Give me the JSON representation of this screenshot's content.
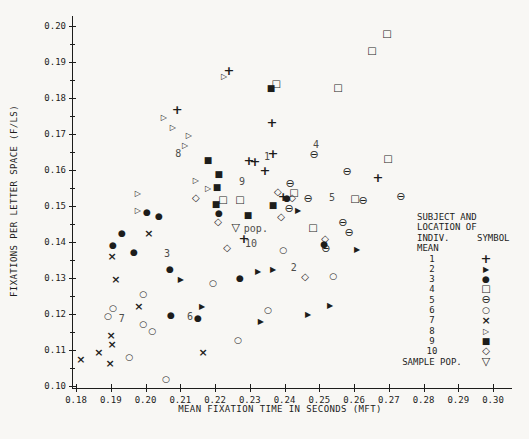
{
  "chart_data": {
    "type": "scatter",
    "title": "",
    "xlabel": "MEAN FIXATION TIME IN SECONDS (MFT)",
    "ylabel": "FIXATIONS PER LETTER SPACE (F/LS)",
    "xlim": [
      0.18,
      0.3
    ],
    "ylim": [
      0.1,
      0.2
    ],
    "xticks": [
      "0.18",
      "0.19",
      "0.20",
      "0.21",
      "0.22",
      "0.23",
      "0.24",
      "0.25",
      "0.26",
      "0.27",
      "0.28",
      "0.29",
      "0.30"
    ],
    "yticks": [
      "0.10",
      "0.11",
      "0.12",
      "0.13",
      "0.14",
      "0.15",
      "0.16",
      "0.17",
      "0.18",
      "0.19",
      "0.20"
    ],
    "y_minor_tick_step": 0.005,
    "grid": false,
    "legend_position": "right-middle",
    "series": [
      {
        "name": "1",
        "symbol": "+",
        "points": [
          [
            0.2091,
            0.1769
          ],
          [
            0.224,
            0.1878
          ],
          [
            0.2298,
            0.1628
          ],
          [
            0.2315,
            0.1625
          ],
          [
            0.2367,
            0.1647
          ],
          [
            0.2344,
            0.16
          ],
          [
            0.2364,
            0.1733
          ],
          [
            0.2396,
            0.1528
          ],
          [
            0.2283,
            0.1411
          ],
          [
            0.2669,
            0.1581
          ]
        ]
      },
      {
        "name": "2",
        "symbol": "▶",
        "points": [
          [
            0.2439,
            0.1486
          ],
          [
            0.2609,
            0.1378
          ],
          [
            0.2324,
            0.1317
          ],
          [
            0.2367,
            0.1322
          ],
          [
            0.2468,
            0.1197
          ],
          [
            0.2531,
            0.1222
          ],
          [
            0.2332,
            0.1178
          ],
          [
            0.2163,
            0.1219
          ],
          [
            0.2102,
            0.1294
          ]
        ]
      },
      {
        "name": "3",
        "symbol": "●",
        "points": [
          [
            0.2004,
            0.1483
          ],
          [
            0.2039,
            0.1472
          ],
          [
            0.1932,
            0.1425
          ],
          [
            0.1906,
            0.1392
          ],
          [
            0.1967,
            0.1372
          ],
          [
            0.207,
            0.1325
          ],
          [
            0.2272,
            0.13
          ],
          [
            0.2073,
            0.1197
          ],
          [
            0.2151,
            0.1189
          ],
          [
            0.2211,
            0.1481
          ],
          [
            0.2407,
            0.1522
          ],
          [
            0.2514,
            0.1394
          ]
        ]
      },
      {
        "name": "4",
        "symbol": "□",
        "points": [
          [
            0.2376,
            0.1839
          ],
          [
            0.2554,
            0.1828
          ],
          [
            0.2695,
            0.1978
          ],
          [
            0.2652,
            0.1931
          ],
          [
            0.2698,
            0.1631
          ],
          [
            0.2223,
            0.1517
          ],
          [
            0.2272,
            0.1517
          ],
          [
            0.2427,
            0.1536
          ],
          [
            0.2603,
            0.1519
          ],
          [
            0.2482,
            0.1439
          ]
        ]
      },
      {
        "name": "5",
        "symbol": "⊖",
        "points": [
          [
            0.2485,
            0.1644
          ],
          [
            0.258,
            0.1597
          ],
          [
            0.2416,
            0.1564
          ],
          [
            0.2468,
            0.1522
          ],
          [
            0.2626,
            0.1517
          ],
          [
            0.2735,
            0.1528
          ],
          [
            0.2568,
            0.1456
          ],
          [
            0.2586,
            0.1428
          ],
          [
            0.2413,
            0.1494
          ],
          [
            0.2519,
            0.1383
          ]
        ]
      },
      {
        "name": "6",
        "symbol": "○",
        "points": [
          [
            0.1993,
            0.1256
          ],
          [
            0.1906,
            0.1217
          ],
          [
            0.1892,
            0.1194
          ],
          [
            0.1993,
            0.1172
          ],
          [
            0.2019,
            0.1153
          ],
          [
            0.1953,
            0.1081
          ],
          [
            0.2059,
            0.1019
          ],
          [
            0.2266,
            0.1128
          ],
          [
            0.2352,
            0.1211
          ],
          [
            0.2396,
            0.1378
          ],
          [
            0.254,
            0.1306
          ],
          [
            0.2194,
            0.1286
          ]
        ]
      },
      {
        "name": "7",
        "symbol": "×",
        "points": [
          [
            0.201,
            0.1425
          ],
          [
            0.1904,
            0.1361
          ],
          [
            0.1915,
            0.1297
          ],
          [
            0.1981,
            0.1222
          ],
          [
            0.1901,
            0.1142
          ],
          [
            0.1904,
            0.1117
          ],
          [
            0.1866,
            0.1094
          ],
          [
            0.1814,
            0.1075
          ],
          [
            0.1898,
            0.1064
          ],
          [
            0.2166,
            0.1094
          ]
        ]
      },
      {
        "name": "8",
        "symbol": "▷",
        "points": [
          [
            0.2226,
            0.1858
          ],
          [
            0.2053,
            0.1744
          ],
          [
            0.2079,
            0.1717
          ],
          [
            0.2125,
            0.1694
          ],
          [
            0.2114,
            0.1667
          ],
          [
            0.2145,
            0.1569
          ],
          [
            0.218,
            0.1547
          ],
          [
            0.1978,
            0.1533
          ],
          [
            0.1978,
            0.1486
          ]
        ]
      },
      {
        "name": "9",
        "symbol": "■",
        "points": [
          [
            0.2361,
            0.1828
          ],
          [
            0.218,
            0.1628
          ],
          [
            0.2211,
            0.1589
          ],
          [
            0.2206,
            0.1553
          ],
          [
            0.2203,
            0.1506
          ],
          [
            0.2295,
            0.1475
          ],
          [
            0.2367,
            0.1503
          ]
        ]
      },
      {
        "name": "10",
        "symbol": "◇",
        "points": [
          [
            0.2145,
            0.1522
          ],
          [
            0.2209,
            0.1456
          ],
          [
            0.2235,
            0.1383
          ],
          [
            0.2381,
            0.1539
          ],
          [
            0.2422,
            0.1522
          ],
          [
            0.239,
            0.1469
          ],
          [
            0.2459,
            0.1303
          ],
          [
            0.2517,
            0.1408
          ]
        ]
      },
      {
        "name": "SAMPLE POP.",
        "symbol": "▽",
        "points": [
          [
            0.226,
            0.1442
          ]
        ]
      }
    ],
    "annotations": [
      {
        "text": "1",
        "x": 0.235,
        "y": 0.1636
      },
      {
        "text": "2",
        "x": 0.2427,
        "y": 0.1328
      },
      {
        "text": "3",
        "x": 0.2062,
        "y": 0.1367
      },
      {
        "text": "4",
        "x": 0.2491,
        "y": 0.1669
      },
      {
        "text": "5",
        "x": 0.2537,
        "y": 0.1522
      },
      {
        "text": "6",
        "x": 0.2128,
        "y": 0.1192
      },
      {
        "text": "7",
        "x": 0.1932,
        "y": 0.1186
      },
      {
        "text": "8",
        "x": 0.2094,
        "y": 0.1644
      },
      {
        "text": "9",
        "x": 0.2278,
        "y": 0.1567
      },
      {
        "text": "10",
        "x": 0.2304,
        "y": 0.1394
      },
      {
        "text": "pop.",
        "x": 0.2283,
        "y": 0.1436,
        "anchor": "left"
      }
    ],
    "legend": {
      "header_line1": "SUBJECT AND",
      "header_line2": "LOCATION OF",
      "header_line3": "INDIV. MEAN",
      "symbol_header": "SYMBOL",
      "rows": [
        {
          "label": "1",
          "symbol": "+"
        },
        {
          "label": "2",
          "symbol": "▶"
        },
        {
          "label": "3",
          "symbol": "●"
        },
        {
          "label": "4",
          "symbol": "□"
        },
        {
          "label": "5",
          "symbol": "⊖"
        },
        {
          "label": "6",
          "symbol": "○"
        },
        {
          "label": "7",
          "symbol": "×"
        },
        {
          "label": "8",
          "symbol": "▷"
        },
        {
          "label": "9",
          "symbol": "■"
        },
        {
          "label": "10",
          "symbol": "◇"
        },
        {
          "label": "SAMPLE POP.",
          "symbol": "▽"
        }
      ]
    },
    "ink_color": "#1d1d1b"
  }
}
